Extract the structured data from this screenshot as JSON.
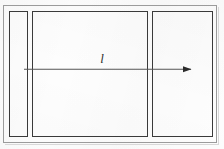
{
  "figure": {
    "kind": "technical-line-drawing",
    "background_color": "#fdfdfd",
    "frame": {
      "label": "outer frame",
      "stroke_color": "#9b9b9b",
      "x": 3,
      "y": 5,
      "width": 214,
      "height": 138
    },
    "panels": [
      {
        "name": "left-panel",
        "x": 9,
        "y": 11,
        "width": 19,
        "height": 126,
        "stroke_color": "#3a3a3a"
      },
      {
        "name": "center-panel",
        "x": 32,
        "y": 11,
        "width": 116,
        "height": 126,
        "stroke_color": "#3a3a3a"
      },
      {
        "name": "right-panel",
        "x": 152,
        "y": 11,
        "width": 61,
        "height": 126,
        "stroke_color": "#3a3a3a"
      }
    ],
    "dimension": {
      "label": "l",
      "label_x": 100,
      "label_y": 59,
      "arrow_start_x": 24,
      "arrow_end_x": 194,
      "arrow_y": 69,
      "stroke_color": "#555555",
      "head_color": "#2b2b2b",
      "direction": "right"
    }
  }
}
